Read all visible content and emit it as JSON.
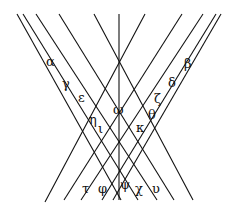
{
  "diagram": {
    "lines": [
      {
        "x1": 17,
        "y1": 14,
        "x2": 121,
        "y2": 200
      },
      {
        "x1": 23,
        "y1": 14,
        "x2": 138,
        "y2": 200
      },
      {
        "x1": 36,
        "y1": 14,
        "x2": 157,
        "y2": 200
      },
      {
        "x1": 59,
        "y1": 14,
        "x2": 174,
        "y2": 200
      },
      {
        "x1": 94,
        "y1": 14,
        "x2": 193,
        "y2": 200
      },
      {
        "x1": 119,
        "y1": 14,
        "x2": 119,
        "y2": 200
      },
      {
        "x1": 145,
        "y1": 14,
        "x2": 45,
        "y2": 202
      },
      {
        "x1": 182,
        "y1": 14,
        "x2": 64,
        "y2": 200
      },
      {
        "x1": 203,
        "y1": 14,
        "x2": 81,
        "y2": 200
      },
      {
        "x1": 216,
        "y1": 14,
        "x2": 102,
        "y2": 200
      },
      {
        "x1": 221,
        "y1": 14,
        "x2": 113,
        "y2": 200
      }
    ],
    "labels": [
      {
        "text": "α",
        "x": 46,
        "y": 66
      },
      {
        "text": "γ",
        "x": 62,
        "y": 88
      },
      {
        "text": "ε",
        "x": 78,
        "y": 102
      },
      {
        "text": "β",
        "x": 184,
        "y": 68
      },
      {
        "text": "δ",
        "x": 168,
        "y": 87
      },
      {
        "text": "ζ",
        "x": 154,
        "y": 103
      },
      {
        "text": "ω",
        "x": 113,
        "y": 114
      },
      {
        "text": "η",
        "x": 89,
        "y": 124
      },
      {
        "text": "ι",
        "x": 98,
        "y": 133
      },
      {
        "text": "θ",
        "x": 148,
        "y": 119
      },
      {
        "text": "κ",
        "x": 136,
        "y": 132
      },
      {
        "text": "τ",
        "x": 82,
        "y": 193
      },
      {
        "text": "φ",
        "x": 98,
        "y": 193
      },
      {
        "text": "ψ",
        "x": 120,
        "y": 189
      },
      {
        "text": "χ",
        "x": 135,
        "y": 193
      },
      {
        "text": "υ",
        "x": 152,
        "y": 193
      }
    ]
  }
}
